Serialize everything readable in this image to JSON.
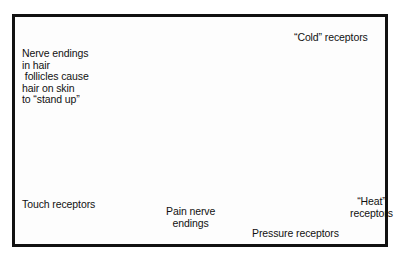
{
  "figure": {
    "style": "grayscale anatomical illustration in black rectangular frame",
    "border_color": "#111111",
    "background_color": "#ffffff"
  },
  "labels": {
    "nerve_endings": "Nerve endings\nin hair\n follicles cause\nhair on skin\nto “stand up”",
    "cold_receptors": "“Cold” receptors",
    "touch_receptors": "Touch receptors",
    "pain_nerve_endings": "Pain nerve\nendings",
    "pressure_receptors": "Pressure receptors",
    "heat_receptors": "“Heat”\nreceptors"
  },
  "structures": [
    {
      "name": "hair-shaft-left",
      "description": "long dark curved hair rising from follicle"
    },
    {
      "name": "hair-shaft-right",
      "description": "second dark hair through epidermis"
    },
    {
      "name": "epidermis",
      "description": "light gray wavy top layer slab",
      "color": "#d8d8d8"
    },
    {
      "name": "dermis",
      "description": "dark gray middle band",
      "color": "#8a8a8a"
    },
    {
      "name": "subcutaneous",
      "description": "pale lower block",
      "color": "#efefef"
    },
    {
      "name": "cold-receptor-cluster",
      "description": "dotted oval network in dermis"
    },
    {
      "name": "hair-follicle-bulb",
      "description": "oval bulb around hair root"
    },
    {
      "name": "touch-receptor-body",
      "description": "small round corpuscle"
    },
    {
      "name": "pain-nerve-plexus",
      "description": "branched free nerve endings"
    },
    {
      "name": "nerve-trunk",
      "description": "thick branched nerve in lower dermis"
    },
    {
      "name": "pacinian-corpuscle",
      "description": "layered onion-like pressure receptor"
    },
    {
      "name": "ruffini-ending",
      "description": "fan-shaped heat receptor"
    }
  ],
  "pointer_lines": [
    {
      "from": "nerve_endings",
      "to": "hair-follicle-bulb"
    },
    {
      "from": "cold_receptors",
      "to": "cold-receptor-cluster"
    },
    {
      "from": "touch_receptors",
      "to": "touch-receptor-body"
    },
    {
      "from": "pain_nerve_endings",
      "to": "pain-nerve-plexus"
    },
    {
      "from": "pressure_receptors",
      "to": "pacinian-corpuscle"
    },
    {
      "from": "heat_receptors",
      "to": "ruffini-ending"
    }
  ]
}
